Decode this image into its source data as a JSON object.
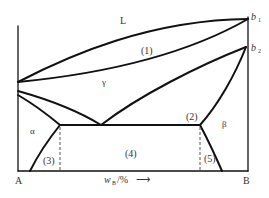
{
  "diagram": {
    "type": "binary phase diagram",
    "colors": {
      "line": "#111111",
      "text": "#333333",
      "background": "#ffffff"
    },
    "labels": {
      "liquid": "L",
      "gamma": "γ",
      "alpha": "α",
      "beta": "β",
      "region1": "(1)",
      "region2": "(2)",
      "region3": "(3)",
      "region4": "(4)",
      "region5": "(5)",
      "point_b1": "b",
      "point_b1_sub": "1",
      "point_b2": "b",
      "point_b2_sub": "2",
      "component_a": "A",
      "component_b": "B",
      "x_axis_w": "w",
      "x_axis_sub": "B",
      "x_axis_unit": "/%",
      "x_axis_arrow": "⟶"
    }
  }
}
